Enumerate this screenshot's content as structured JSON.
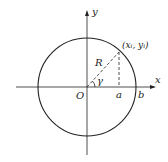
{
  "diagram": {
    "title": "",
    "labels": {
      "y_axis": "y",
      "x_axis": "x",
      "origin": "O",
      "radius": "R",
      "angle": "γ",
      "point": "(xᵢ, yᵢ)",
      "a": "a",
      "b": "b"
    },
    "colors": {
      "stroke": "#222222",
      "background": "#ffffff"
    }
  }
}
